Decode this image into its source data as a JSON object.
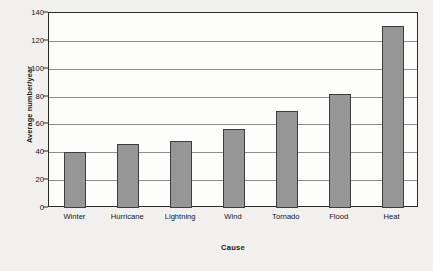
{
  "chart_data": {
    "type": "bar",
    "title": "",
    "subtitle": "",
    "xlabel": "Cause",
    "ylabel": "Average number/year",
    "categories": [
      "Winter",
      "Hurricane",
      "Lightning",
      "Wind",
      "Tornado",
      "Flood",
      "Heat"
    ],
    "values": [
      40,
      46,
      48,
      57,
      70,
      82,
      131
    ],
    "series": [
      {
        "name": "Average number/year",
        "values": [
          40,
          46,
          48,
          57,
          70,
          82,
          131
        ]
      }
    ],
    "ylim": [
      0,
      140
    ],
    "ytick_labels": [
      "0",
      "20",
      "40",
      "60",
      "80",
      "100",
      "120",
      "140"
    ],
    "ytick_values": [
      0,
      20,
      40,
      60,
      80,
      100,
      120,
      140
    ],
    "grid": "horizontal",
    "legend": "none",
    "annotations": [],
    "colors": {
      "bar_fill": "#969696",
      "bar_outline": "#3d3d3d",
      "plot_background": "#fdfdfc",
      "page_background": "#f2f0ee",
      "axis": "#2b2b2b",
      "gridline": "#8d8d8d",
      "text": "#141414"
    }
  }
}
